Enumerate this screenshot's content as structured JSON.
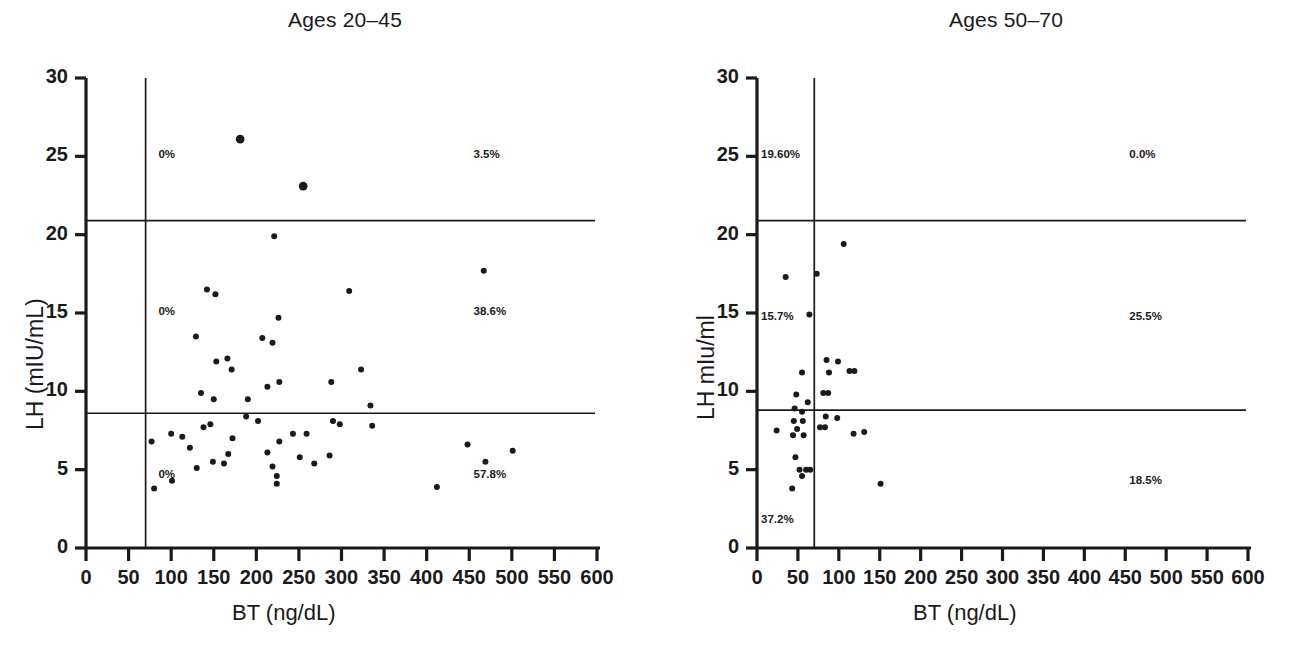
{
  "figure": {
    "background": "#ffffff",
    "ink": "#1a1a1a",
    "panel_count": 2
  },
  "panels": [
    {
      "id": "ages-20-45",
      "title": "Ages 20–45",
      "xlabel": "BT (ng/dL)",
      "ylabel": "LH (mIU/mL)",
      "quadrant_labels": {
        "upper_left": "0%",
        "upper_right": "3.5%",
        "middle_left": "0%",
        "middle_right": "38.6%",
        "lower_left": "0%",
        "lower_right": "57.8%"
      }
    },
    {
      "id": "ages-50-70",
      "title": "Ages 50–70",
      "xlabel": "BT (ng/dL)",
      "ylabel": "LH mIu/ml",
      "quadrant_labels": {
        "upper_left": "19.60%",
        "upper_right": "0.0%",
        "middle_left": "15.7%",
        "middle_right": "25.5%",
        "lower_left": "37.2%",
        "lower_right": "18.5%"
      }
    }
  ],
  "chart_data": [
    {
      "type": "scatter",
      "title": "Ages 20–45",
      "xlabel": "BT (ng/dL)",
      "ylabel": "LH (mIU/mL)",
      "xlim": [
        0,
        600
      ],
      "ylim": [
        0,
        30
      ],
      "xticks": [
        0,
        50,
        100,
        150,
        200,
        250,
        300,
        350,
        400,
        450,
        500,
        550,
        600
      ],
      "yticks": [
        0,
        5,
        10,
        15,
        20,
        25,
        30
      ],
      "xtick_labels": [
        "0",
        "50",
        "100",
        "150",
        "200",
        "250",
        "300",
        "350",
        "400",
        "450",
        "500",
        "550",
        "600"
      ],
      "ytick_labels": [
        "0",
        "5",
        "10",
        "15",
        "20",
        "25",
        "30"
      ],
      "grid": false,
      "legend": false,
      "reference_lines": {
        "vertical_x": 70,
        "horizontal_upper_y": 20.9,
        "horizontal_lower_y": 8.6
      },
      "annotations": [
        {
          "text": "0%",
          "x": 85,
          "y": 25.0
        },
        {
          "text": "3.5%",
          "x": 455,
          "y": 25.0
        },
        {
          "text": "0%",
          "x": 85,
          "y": 15.0
        },
        {
          "text": "38.6%",
          "x": 455,
          "y": 15.0
        },
        {
          "text": "0%",
          "x": 85,
          "y": 4.6
        },
        {
          "text": "57.8%",
          "x": 455,
          "y": 4.6
        }
      ],
      "points": [
        {
          "x": 181,
          "y": 26.1
        },
        {
          "x": 255,
          "y": 23.1
        },
        {
          "x": 221,
          "y": 19.9
        },
        {
          "x": 467,
          "y": 17.7
        },
        {
          "x": 142,
          "y": 16.5
        },
        {
          "x": 152,
          "y": 16.2
        },
        {
          "x": 309,
          "y": 16.4
        },
        {
          "x": 226,
          "y": 14.7
        },
        {
          "x": 129,
          "y": 13.5
        },
        {
          "x": 207,
          "y": 13.4
        },
        {
          "x": 219,
          "y": 13.1
        },
        {
          "x": 153,
          "y": 11.9
        },
        {
          "x": 166,
          "y": 12.1
        },
        {
          "x": 171,
          "y": 11.4
        },
        {
          "x": 323,
          "y": 11.4
        },
        {
          "x": 213,
          "y": 10.3
        },
        {
          "x": 227,
          "y": 10.6
        },
        {
          "x": 288,
          "y": 10.6
        },
        {
          "x": 135,
          "y": 9.9
        },
        {
          "x": 150,
          "y": 9.5
        },
        {
          "x": 190,
          "y": 9.5
        },
        {
          "x": 334,
          "y": 9.1
        },
        {
          "x": 188,
          "y": 8.4
        },
        {
          "x": 202,
          "y": 8.1
        },
        {
          "x": 290,
          "y": 8.1
        },
        {
          "x": 298,
          "y": 7.9
        },
        {
          "x": 336,
          "y": 7.8
        },
        {
          "x": 146,
          "y": 7.9
        },
        {
          "x": 138,
          "y": 7.7
        },
        {
          "x": 100,
          "y": 7.3
        },
        {
          "x": 113,
          "y": 7.1
        },
        {
          "x": 172,
          "y": 7.0
        },
        {
          "x": 227,
          "y": 6.8
        },
        {
          "x": 243,
          "y": 7.3
        },
        {
          "x": 259,
          "y": 7.3
        },
        {
          "x": 77,
          "y": 6.8
        },
        {
          "x": 448,
          "y": 6.6
        },
        {
          "x": 501,
          "y": 6.2
        },
        {
          "x": 122,
          "y": 6.4
        },
        {
          "x": 167,
          "y": 6.0
        },
        {
          "x": 213,
          "y": 6.1
        },
        {
          "x": 251,
          "y": 5.8
        },
        {
          "x": 268,
          "y": 5.4
        },
        {
          "x": 286,
          "y": 5.9
        },
        {
          "x": 149,
          "y": 5.5
        },
        {
          "x": 162,
          "y": 5.4
        },
        {
          "x": 219,
          "y": 5.2
        },
        {
          "x": 469,
          "y": 5.5
        },
        {
          "x": 130,
          "y": 5.1
        },
        {
          "x": 224,
          "y": 4.6
        },
        {
          "x": 101,
          "y": 4.3
        },
        {
          "x": 80,
          "y": 3.8
        },
        {
          "x": 224,
          "y": 4.1
        },
        {
          "x": 412,
          "y": 3.9
        }
      ]
    },
    {
      "type": "scatter",
      "title": "Ages 50–70",
      "xlabel": "BT (ng/dL)",
      "ylabel": "LH mIu/ml",
      "xlim": [
        0,
        600
      ],
      "ylim": [
        0,
        30
      ],
      "xticks": [
        0,
        50,
        100,
        150,
        200,
        250,
        300,
        350,
        400,
        450,
        500,
        550,
        600
      ],
      "yticks": [
        0,
        5,
        10,
        15,
        20,
        25,
        30
      ],
      "xtick_labels": [
        "0",
        "50",
        "100",
        "150",
        "200",
        "250",
        "300",
        "350",
        "400",
        "450",
        "500",
        "550",
        "600"
      ],
      "ytick_labels": [
        "0",
        "5",
        "10",
        "15",
        "20",
        "25",
        "30"
      ],
      "grid": false,
      "legend": false,
      "reference_lines": {
        "vertical_x": 70,
        "horizontal_upper_y": 20.9,
        "horizontal_lower_y": 8.8
      },
      "annotations": [
        {
          "text": "19.60%",
          "x": 5,
          "y": 25.0
        },
        {
          "text": "0.0%",
          "x": 455,
          "y": 25.0
        },
        {
          "text": "15.7%",
          "x": 5,
          "y": 14.7
        },
        {
          "text": "25.5%",
          "x": 455,
          "y": 14.7
        },
        {
          "text": "37.2%",
          "x": 5,
          "y": 1.7
        },
        {
          "text": "18.5%",
          "x": 455,
          "y": 4.2
        }
      ],
      "points": [
        {
          "x": 106,
          "y": 19.4
        },
        {
          "x": 35,
          "y": 17.3
        },
        {
          "x": 73,
          "y": 17.5
        },
        {
          "x": 64,
          "y": 14.9
        },
        {
          "x": 85,
          "y": 12.0
        },
        {
          "x": 99,
          "y": 11.9
        },
        {
          "x": 55,
          "y": 11.2
        },
        {
          "x": 88,
          "y": 11.2
        },
        {
          "x": 113,
          "y": 11.3
        },
        {
          "x": 119,
          "y": 11.3
        },
        {
          "x": 48,
          "y": 9.8
        },
        {
          "x": 81,
          "y": 9.9
        },
        {
          "x": 87,
          "y": 9.9
        },
        {
          "x": 62,
          "y": 9.3
        },
        {
          "x": 46,
          "y": 8.9
        },
        {
          "x": 55,
          "y": 8.7
        },
        {
          "x": 84,
          "y": 8.4
        },
        {
          "x": 98,
          "y": 8.3
        },
        {
          "x": 45,
          "y": 8.1
        },
        {
          "x": 56,
          "y": 8.1
        },
        {
          "x": 24,
          "y": 7.5
        },
        {
          "x": 49,
          "y": 7.6
        },
        {
          "x": 77,
          "y": 7.7
        },
        {
          "x": 83,
          "y": 7.7
        },
        {
          "x": 44,
          "y": 7.2
        },
        {
          "x": 57,
          "y": 7.2
        },
        {
          "x": 118,
          "y": 7.3
        },
        {
          "x": 131,
          "y": 7.4
        },
        {
          "x": 47,
          "y": 5.8
        },
        {
          "x": 52,
          "y": 5.0
        },
        {
          "x": 60,
          "y": 5.0
        },
        {
          "x": 65,
          "y": 5.0
        },
        {
          "x": 55,
          "y": 4.6
        },
        {
          "x": 43,
          "y": 3.8
        },
        {
          "x": 151,
          "y": 4.1
        }
      ]
    }
  ]
}
